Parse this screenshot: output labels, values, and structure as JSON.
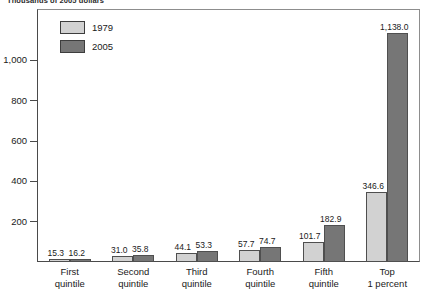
{
  "unit_note": "Thousands of 2005 dollars",
  "legend": {
    "position": "top-left-inside",
    "items": [
      {
        "label": "1979",
        "color": "#d2d2d2",
        "icon": "legend-swatch-icon"
      },
      {
        "label": "2005",
        "color": "#767676",
        "icon": "legend-swatch-icon"
      }
    ]
  },
  "chart_data": {
    "type": "bar",
    "title": "",
    "subtitle": "Thousands of 2005 dollars",
    "xlabel": "",
    "ylabel": "",
    "grid": false,
    "legend_position": "top-left-inside",
    "categories": [
      "First quintile",
      "Second quintile",
      "Third quintile",
      "Fourth quintile",
      "Fifth quintile",
      "Top 1 percent"
    ],
    "category_lines": [
      [
        "First",
        "quintile"
      ],
      [
        "Second",
        "quintile"
      ],
      [
        "Third",
        "quintile"
      ],
      [
        "Fourth",
        "quintile"
      ],
      [
        "Fifth",
        "quintile"
      ],
      [
        "Top",
        "1 percent"
      ]
    ],
    "series": [
      {
        "name": "1979",
        "color": "#d2d2d2",
        "values": [
          15.3,
          31.0,
          44.1,
          57.7,
          101.7,
          346.6
        ],
        "labels": [
          "15.3",
          "31.0",
          "44.1",
          "57.7",
          "101.7",
          "346.6"
        ]
      },
      {
        "name": "2005",
        "color": "#767676",
        "values": [
          16.2,
          35.8,
          53.3,
          74.7,
          182.9,
          1138.0
        ],
        "labels": [
          "16.2",
          "35.8",
          "53.3",
          "74.7",
          "182.9",
          "1,138.0"
        ]
      }
    ],
    "ylim": [
      0,
      1250
    ],
    "yticks": [
      200,
      400,
      600,
      800,
      1000
    ],
    "ytick_labels": [
      "200",
      "400",
      "600",
      "800",
      "1,000"
    ]
  },
  "colors": {
    "series_1979": "#d2d2d2",
    "series_2005": "#767676",
    "axis": "#4a4a4a",
    "frame": "#8d8d8d",
    "text": "#1a1a1a"
  }
}
